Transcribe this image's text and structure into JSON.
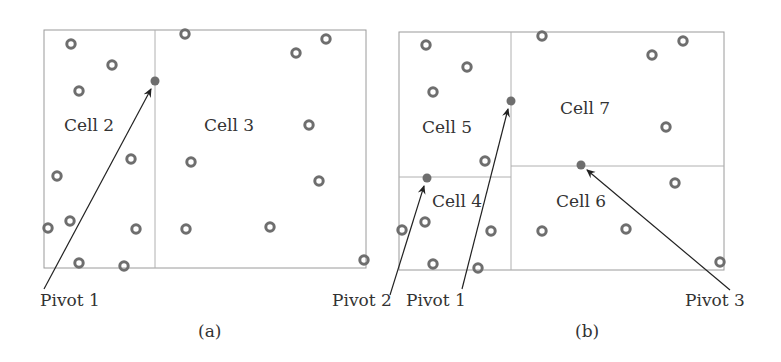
{
  "panels": [
    {
      "caption": "(a)",
      "cells": [
        {
          "label": "Cell 2"
        },
        {
          "label": "Cell 3"
        }
      ],
      "pivots": [
        {
          "label": "Pivot 1"
        }
      ]
    },
    {
      "caption": "(b)",
      "cells": [
        {
          "label": "Cell 5"
        },
        {
          "label": "Cell 7"
        },
        {
          "label": "Cell 4"
        },
        {
          "label": "Cell 6"
        }
      ],
      "pivots": [
        {
          "label": "Pivot 2"
        },
        {
          "label": "Pivot 1"
        },
        {
          "label": "Pivot 3"
        }
      ]
    }
  ],
  "colors": {
    "frame": "#9a9a9a",
    "point": "#6e6e6e",
    "pivot": "#6e6e6e",
    "arrow": "#222222",
    "text": "#333333"
  }
}
